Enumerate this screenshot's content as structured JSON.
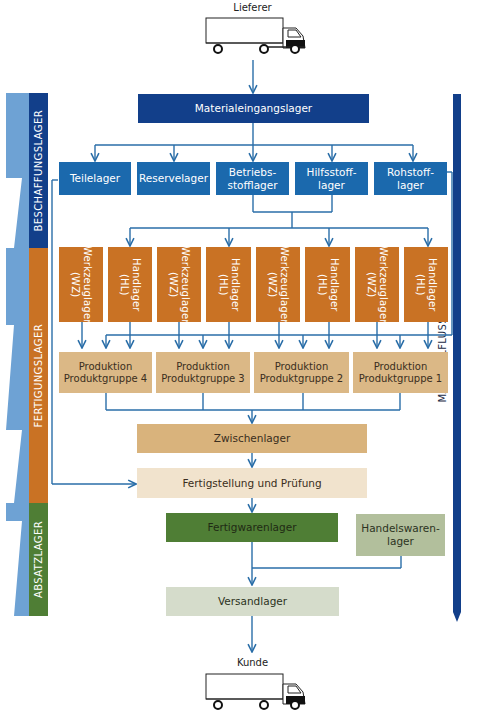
{
  "supplier_label": "Lieferer",
  "customer_label": "Kunde",
  "material_flow_label": "MATERIALFLUSS",
  "sections": {
    "procurement": "BESCHAFFUNGSLAGER",
    "production": "FERTIGUNGSLAGER",
    "sales": "ABSATZLAGER"
  },
  "nodes": {
    "incoming": "Materialeingangslager",
    "parts": "Teilelager",
    "reserve": "Reservelager",
    "operating": "Betriebs-\nstofflager",
    "auxiliary": "Hilfsstoff-\nlager",
    "raw": "Rohstoff-\nlager",
    "tool": "Werkzeuglager\n(WZ)",
    "hand": "Handlager\n(HL)",
    "prod4": "Produktion\nProduktgruppe 4",
    "prod3": "Produktion\nProduktgruppe 3",
    "prod2": "Produktion\nProduktgruppe 2",
    "prod1": "Produktion\nProduktgruppe 1",
    "intermediate": "Zwischenlager",
    "finishing": "Fertigstellung und Prüfung",
    "finished_goods": "Fertigwarenlager",
    "merchandise": "Handelswaren-\nlager",
    "shipping": "Versandlager"
  },
  "colors": {
    "procurement": "#123f8a",
    "production": "#c97224",
    "sales": "#4f7e35",
    "flow_line": "#2a6ea8",
    "side_arrow": "#6ea2d4"
  }
}
